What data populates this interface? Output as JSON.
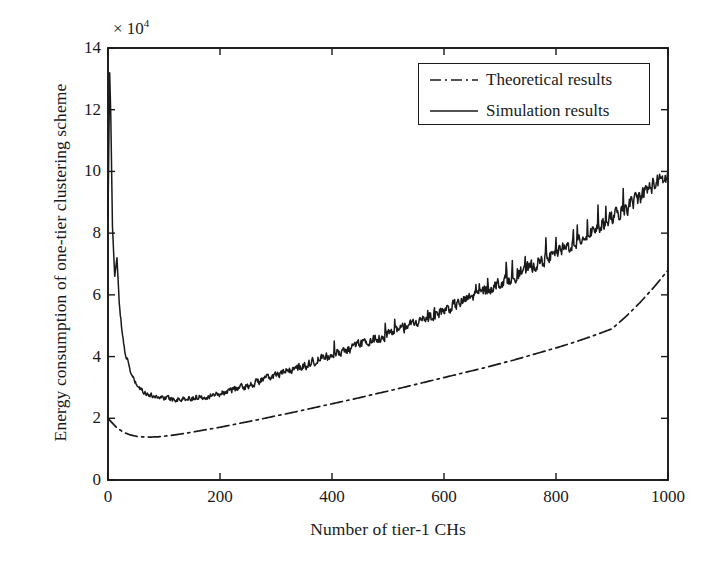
{
  "chart_data": {
    "type": "line",
    "title": "",
    "xlabel": "Number of tier-1 CHs",
    "ylabel": "Energy consumption of one-tier clustering scheme",
    "y_multiplier": "× 10",
    "y_multiplier_exponent": "4",
    "xlim": [
      0,
      1000
    ],
    "ylim": [
      0,
      140000
    ],
    "xticks": [
      0,
      200,
      400,
      600,
      800,
      1000
    ],
    "yticks": [
      0,
      20000,
      40000,
      60000,
      80000,
      100000,
      120000,
      140000
    ],
    "xtick_labels": [
      "0",
      "200",
      "400",
      "600",
      "800",
      "1000"
    ],
    "ytick_labels": [
      "0",
      "2",
      "4",
      "6",
      "8",
      "10",
      "12",
      "14"
    ],
    "grid": false,
    "legend_position": "upper right",
    "series": [
      {
        "name": "Theoretical results",
        "style": "dash-dot",
        "color": "#1a1a1a",
        "x": [
          0,
          5,
          10,
          15,
          20,
          25,
          30,
          40,
          50,
          60,
          75,
          90,
          110,
          130,
          150,
          175,
          200,
          225,
          250,
          275,
          300,
          325,
          350,
          375,
          400,
          425,
          450,
          475,
          500,
          525,
          550,
          575,
          600,
          625,
          650,
          675,
          700,
          725,
          750,
          775,
          800,
          825,
          850,
          875,
          900,
          925,
          950,
          975,
          1000
        ],
        "y": [
          20000,
          19000,
          18000,
          17100,
          16400,
          15800,
          15300,
          14600,
          14200,
          14000,
          13900,
          14000,
          14400,
          14900,
          15500,
          16300,
          17100,
          18000,
          18900,
          19800,
          20800,
          21700,
          22700,
          23700,
          24700,
          25700,
          26700,
          27800,
          28800,
          29900,
          31000,
          32100,
          33200,
          34300,
          35400,
          36500,
          37700,
          38900,
          40200,
          41500,
          42800,
          44200,
          45700,
          47300,
          49000,
          53000,
          57500,
          62500,
          68000
        ]
      },
      {
        "name": "Simulation results",
        "style": "solid",
        "color": "#1a1a1a",
        "x": [
          0,
          3,
          5,
          8,
          12,
          16,
          20,
          25,
          30,
          40,
          50,
          60,
          75,
          90,
          110,
          130,
          150,
          175,
          200,
          225,
          250,
          275,
          300,
          325,
          350,
          375,
          400,
          425,
          450,
          475,
          500,
          525,
          550,
          575,
          600,
          625,
          650,
          675,
          700,
          725,
          750,
          775,
          800,
          825,
          850,
          875,
          900,
          925,
          950,
          975,
          1000
        ],
        "y": [
          85000,
          132000,
          118000,
          82000,
          66000,
          72000,
          58000,
          48000,
          42000,
          35000,
          31000,
          29000,
          27500,
          27000,
          26400,
          26200,
          26600,
          27200,
          28000,
          29500,
          30500,
          32500,
          34000,
          35500,
          37000,
          39000,
          40500,
          42000,
          44000,
          45500,
          47000,
          49000,
          51000,
          53000,
          55000,
          57000,
          59500,
          61500,
          64000,
          66000,
          68500,
          71000,
          73500,
          76000,
          79000,
          82000,
          85000,
          88000,
          92000,
          96000,
          98000
        ]
      }
    ],
    "notes": {
      "simulation_peak_value": 132000,
      "simulation_peak_x": 5,
      "simulation_minimum_value": 26200,
      "simulation_minimum_x": 130,
      "theoretical_minimum_value": 13900,
      "theoretical_minimum_x": 75,
      "noise": "simulation curve is noisy with amplitude growing toward large x"
    }
  },
  "legend": {
    "entries": [
      {
        "label": "Theoretical results",
        "style": "dash-dot"
      },
      {
        "label": "Simulation results",
        "style": "solid"
      }
    ]
  },
  "colors": {
    "line": "#1a1a1a",
    "axis": "#1a1a1a",
    "background": "#ffffff"
  }
}
